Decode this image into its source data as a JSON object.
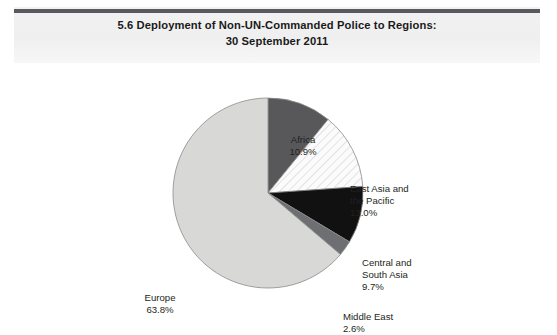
{
  "header": {
    "title_line1": "5.6   Deployment of Non-UN-Commanded Police to Regions:",
    "title_line2": "30 September 2011"
  },
  "chart_data": {
    "type": "pie",
    "title": "5.6   Deployment of Non-UN-Commanded Police to Regions: 30 September 2011",
    "xlabel": "",
    "ylabel": "",
    "units": "percent",
    "start_angle_deg": 0,
    "direction": "clockwise",
    "legend": "none",
    "grid": false,
    "categories": [
      "Africa",
      "East Asia and the Pacific",
      "Central and South Asia",
      "Middle East",
      "Europe"
    ],
    "values": [
      10.9,
      13.0,
      9.7,
      2.6,
      63.8
    ],
    "labels": [
      {
        "name": "Africa",
        "value_text": "10.9%",
        "value": 10.9,
        "fill": "#58585b",
        "pattern": "solid"
      },
      {
        "name_line1": "East Asia and",
        "name_line2": "the Pacific",
        "value_text": "13.0%",
        "value": 13.0,
        "fill": "#fbfbfb",
        "pattern": "diagonal-hatch"
      },
      {
        "name_line1": "Central and",
        "name_line2": "South Asia",
        "value_text": "9.7%",
        "value": 9.7,
        "fill": "#111111",
        "pattern": "solid"
      },
      {
        "name": "Middle East",
        "value_text": "2.6%",
        "value": 2.6,
        "fill": "#6e6f72",
        "pattern": "solid"
      },
      {
        "name": "Europe",
        "value_text": "63.8%",
        "value": 63.8,
        "fill": "#d8d8d6",
        "pattern": "solid"
      }
    ],
    "colors": {
      "africa": "#58585b",
      "east_asia_pacific": "#fbfbfb",
      "central_south_asia": "#111111",
      "middle_east": "#6e6f72",
      "europe": "#d8d8d6",
      "slice_outline": "#8a8a8a",
      "header_rule": "#595a5e",
      "header_band": "#f1f1f1",
      "text": "#231f20"
    },
    "geometry": {
      "center_x": 268,
      "center_y": 130,
      "radius": 95
    }
  }
}
